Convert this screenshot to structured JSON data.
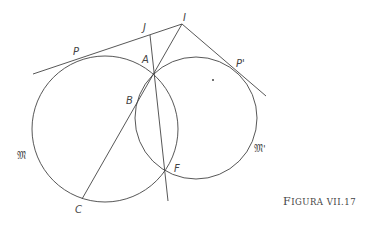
{
  "diagram": {
    "caption": {
      "big": "F",
      "small": "IGURA VII.17"
    },
    "labels": {
      "P": "P",
      "J": "J",
      "I": "I",
      "A": "A",
      "B": "B",
      "P_prime": "P'",
      "F": "F",
      "C": "C",
      "M": "𝔐",
      "M_prime": "𝔐'"
    },
    "circles": [
      {
        "name": "M",
        "cx": 105,
        "cy": 129,
        "r": 73
      },
      {
        "name": "M'",
        "cx": 196,
        "cy": 118,
        "r": 61
      }
    ],
    "points": {
      "I": [
        182,
        24
      ],
      "J": [
        150,
        35
      ],
      "A": [
        154,
        73
      ],
      "F": [
        165,
        171
      ],
      "C": [
        82,
        199
      ],
      "P": [
        75,
        60
      ],
      "P_prime": [
        240,
        72
      ],
      "dot": [
        213,
        80
      ]
    },
    "stroke_color": "#444444"
  }
}
